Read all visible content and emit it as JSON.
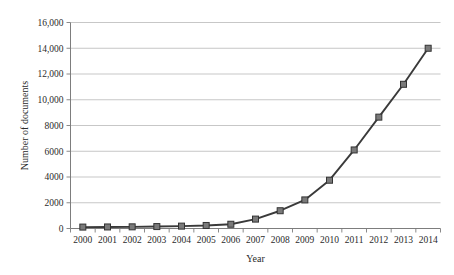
{
  "chart_data": {
    "type": "line",
    "title": "",
    "xlabel": "Year",
    "ylabel": "Number of documents",
    "categories": [
      "2000",
      "2001",
      "2002",
      "2003",
      "2004",
      "2005",
      "2006",
      "2007",
      "2008",
      "2009",
      "2010",
      "2011",
      "2012",
      "2013",
      "2014"
    ],
    "values": [
      110,
      120,
      130,
      150,
      185,
      235,
      330,
      730,
      1380,
      2220,
      3750,
      6100,
      8650,
      11200,
      14000
    ],
    "series": [
      {
        "name": "Number of documents",
        "values": [
          110,
          120,
          130,
          150,
          185,
          235,
          330,
          730,
          1380,
          2220,
          3750,
          6100,
          8650,
          11200,
          14000
        ]
      }
    ],
    "ylim": [
      0,
      16000
    ],
    "ytick_values": [
      0,
      2000,
      4000,
      6000,
      8000,
      10000,
      12000,
      14000,
      16000
    ],
    "ytick_labels": [
      "0",
      "2000",
      "4000",
      "6000",
      "8000",
      "10,000",
      "12,000",
      "14,000",
      "16,000"
    ],
    "xtick_labels": [
      "2000",
      "2001",
      "2002",
      "2003",
      "2004",
      "2005",
      "2006",
      "2007",
      "2008",
      "2009",
      "2010",
      "2011",
      "2012",
      "2013",
      "2014"
    ],
    "grid": "horizontal",
    "legend": "none",
    "marker": "square",
    "colors": {
      "line": "#3a3a3a",
      "marker_fill": "#7a7a7a",
      "marker_stroke": "#333333",
      "gridline": "#b9b9b9",
      "axis": "#7d7d7d",
      "text": "#2b2b2b",
      "background": "#ffffff"
    }
  }
}
